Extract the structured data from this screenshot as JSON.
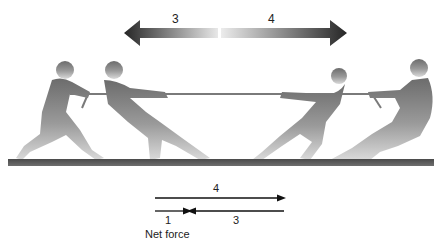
{
  "top_arrow": {
    "left_label": "3",
    "right_label": "4"
  },
  "vector_diagram": {
    "top_arrow_label": "4",
    "left_arrow_label": "1",
    "right_arrow_label": "3",
    "caption": "Net force"
  },
  "figures": {
    "left_team": [
      "puller-1",
      "puller-2"
    ],
    "right_team": [
      "puller-3",
      "puller-4"
    ]
  },
  "colors": {
    "arrow_dark": "#2a2a2a",
    "arrow_light": "#e6e6e6",
    "silhouette_top": "#6a6a6a",
    "silhouette_bottom": "#d4d4d4",
    "ground": "#5a5a5a",
    "rope": "#7a7a7a"
  }
}
